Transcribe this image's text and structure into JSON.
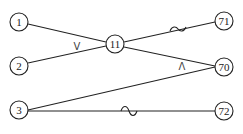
{
  "diagram": {
    "type": "network-graph",
    "nodes": [
      {
        "id": "1",
        "label": "1",
        "x": 19,
        "y": 22
      },
      {
        "id": "2",
        "label": "2",
        "x": 19,
        "y": 66
      },
      {
        "id": "3",
        "label": "3",
        "x": 19,
        "y": 110
      },
      {
        "id": "11",
        "label": "11",
        "x": 115,
        "y": 44
      },
      {
        "id": "71",
        "label": "71",
        "x": 224,
        "y": 21
      },
      {
        "id": "70",
        "label": "70",
        "x": 224,
        "y": 67
      },
      {
        "id": "72",
        "label": "72",
        "x": 224,
        "y": 111
      }
    ],
    "edges": [
      {
        "from": "1",
        "to": "11",
        "mark": ""
      },
      {
        "from": "2",
        "to": "11",
        "mark": "V"
      },
      {
        "from": "11",
        "to": "71",
        "mark": "~"
      },
      {
        "from": "11",
        "to": "70",
        "mark": ""
      },
      {
        "from": "3",
        "to": "70",
        "mark": "Λ"
      },
      {
        "from": "3",
        "to": "72",
        "mark": "~"
      }
    ],
    "marks": {
      "or_symbol": "V",
      "and_symbol": "Λ"
    },
    "node_radius": 9,
    "colors": {
      "stroke": "#222222",
      "background": "#ffffff"
    }
  }
}
